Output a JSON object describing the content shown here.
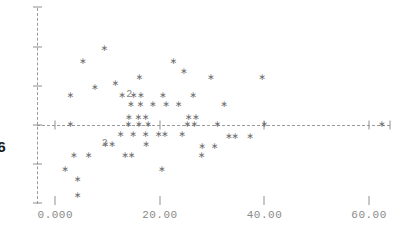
{
  "chart_data": {
    "type": "scatter",
    "title": "",
    "subtitle": "",
    "xlabel": "",
    "ylabel": "6",
    "xlim": [
      -3.5,
      64.0
    ],
    "ylim": [
      -4.2,
      6.2
    ],
    "grid": false,
    "legend": null,
    "marker": "asterisk",
    "marker_color": "#6e6e6e",
    "axis_color": "#9b9b9b",
    "axis_style": "dashed",
    "zero_line": {
      "y": 0,
      "style": "dashed",
      "color": "#9b9b9b"
    },
    "x_ticks": [
      0,
      20,
      40,
      60
    ],
    "x_tick_labels": [
      "0.000",
      "20.00",
      "40.00",
      "60.00"
    ],
    "y_ticks": [
      6,
      4,
      2,
      0,
      -2,
      -4
    ],
    "y_tick_labels": [
      "",
      "",
      "",
      "",
      "",
      ""
    ],
    "overlap_labels": [
      {
        "x": 12.8,
        "y": 1.55,
        "text": "2",
        "count": 2
      },
      {
        "x": 8.1,
        "y": -0.95,
        "text": "2",
        "count": 2
      }
    ],
    "points": [
      {
        "x": 5.3,
        "y": 3.25
      },
      {
        "x": 9.4,
        "y": 3.95
      },
      {
        "x": 22.6,
        "y": 3.25
      },
      {
        "x": 24.6,
        "y": 2.75
      },
      {
        "x": 29.8,
        "y": 2.45
      },
      {
        "x": 39.6,
        "y": 2.45
      },
      {
        "x": 7.6,
        "y": 1.95
      },
      {
        "x": 11.5,
        "y": 2.15
      },
      {
        "x": 16.1,
        "y": 2.45
      },
      {
        "x": 12.8,
        "y": 1.55
      },
      {
        "x": 15.0,
        "y": 1.55
      },
      {
        "x": 16.4,
        "y": 1.55
      },
      {
        "x": 20.6,
        "y": 1.55
      },
      {
        "x": 26.4,
        "y": 1.55
      },
      {
        "x": 2.9,
        "y": 1.55
      },
      {
        "x": 14.5,
        "y": 1.05
      },
      {
        "x": 16.3,
        "y": 1.05
      },
      {
        "x": 18.7,
        "y": 1.05
      },
      {
        "x": 21.2,
        "y": 1.05
      },
      {
        "x": 23.6,
        "y": 1.05
      },
      {
        "x": 32.3,
        "y": 1.05
      },
      {
        "x": 14.1,
        "y": 0.42
      },
      {
        "x": 15.9,
        "y": 0.42
      },
      {
        "x": 17.3,
        "y": 0.42
      },
      {
        "x": 25.5,
        "y": 0.42
      },
      {
        "x": 26.9,
        "y": 0.42
      },
      {
        "x": 2.9,
        "y": 0.05
      },
      {
        "x": 14.0,
        "y": 0.05
      },
      {
        "x": 16.0,
        "y": 0.05
      },
      {
        "x": 17.8,
        "y": 0.05
      },
      {
        "x": 25.3,
        "y": 0.05
      },
      {
        "x": 26.6,
        "y": 0.05
      },
      {
        "x": 31.0,
        "y": 0.05
      },
      {
        "x": 40.0,
        "y": 0.05
      },
      {
        "x": 62.5,
        "y": 0.05
      },
      {
        "x": 12.5,
        "y": -0.48
      },
      {
        "x": 14.9,
        "y": -0.48
      },
      {
        "x": 17.3,
        "y": -0.48
      },
      {
        "x": 19.8,
        "y": -0.48
      },
      {
        "x": 21.0,
        "y": -0.48
      },
      {
        "x": 24.3,
        "y": -0.48
      },
      {
        "x": 9.6,
        "y": -0.95
      },
      {
        "x": 10.9,
        "y": -0.95
      },
      {
        "x": 17.4,
        "y": -0.95
      },
      {
        "x": 28.1,
        "y": -1.05
      },
      {
        "x": 30.5,
        "y": -1.05
      },
      {
        "x": 33.2,
        "y": -0.58
      },
      {
        "x": 34.4,
        "y": -0.58
      },
      {
        "x": 37.3,
        "y": -0.58
      },
      {
        "x": 3.6,
        "y": -1.55
      },
      {
        "x": 6.4,
        "y": -1.55
      },
      {
        "x": 13.4,
        "y": -1.55
      },
      {
        "x": 14.6,
        "y": -1.55
      },
      {
        "x": 28.0,
        "y": -1.55
      },
      {
        "x": 1.9,
        "y": -2.25
      },
      {
        "x": 4.3,
        "y": -2.75
      },
      {
        "x": 4.3,
        "y": -3.55
      },
      {
        "x": 20.4,
        "y": -2.25
      }
    ]
  }
}
